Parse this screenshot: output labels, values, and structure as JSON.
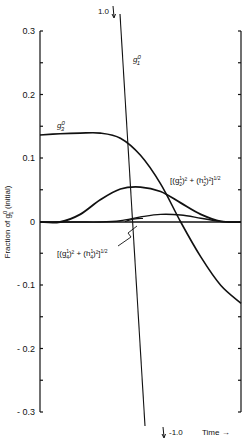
{
  "chart_data": {
    "type": "line",
    "title": "",
    "xlabel": "Time →",
    "ylabel": "Fraction of g₁⁰ (initial)",
    "ylim": [
      -0.3,
      0.3
    ],
    "yticks": [
      0.3,
      0.2,
      0.1,
      0,
      -0.1,
      -0.2,
      -0.3
    ],
    "ytick_labels": [
      "0.3",
      "0.2",
      "0.1",
      "0",
      "- 0.1",
      "- 0.2",
      "- 0.3"
    ],
    "grid": false,
    "legend": "none (curves labelled directly)",
    "x_normalized": [
      0,
      0.1,
      0.2,
      0.3,
      0.4,
      0.5,
      0.6,
      0.7,
      0.8,
      0.9,
      1.0
    ],
    "series": [
      {
        "name": "g₁⁰",
        "label": "g10",
        "note": "steep straight line running from 1.0 (off top) to -1.0 (off bottom)",
        "endpoints": [
          {
            "x": 0.4,
            "y": 1.0
          },
          {
            "x": 0.52,
            "y": -1.0
          }
        ]
      },
      {
        "name": "g₃⁰",
        "label": "g30",
        "values": [
          0.137,
          0.139,
          0.14,
          0.14,
          0.132,
          0.105,
          0.06,
          0.0,
          -0.055,
          -0.1,
          -0.128
        ]
      },
      {
        "name": "[(g₂¹)² + (h₂¹)²]^1/2",
        "label": "g21h21",
        "values": [
          0,
          0.0,
          0.012,
          0.035,
          0.052,
          0.055,
          0.048,
          0.03,
          0.012,
          0.001,
          0
        ]
      },
      {
        "name": "[(g₄¹)² + (h₄¹)²]^1/2",
        "label": "g41h41",
        "values": [
          0,
          0,
          0,
          0,
          0.002,
          0.008,
          0.012,
          0.011,
          0.006,
          0.001,
          0
        ]
      }
    ],
    "annotations": [
      "1.0",
      "-1.0",
      "Time →"
    ]
  },
  "labels": {
    "g1_top": "1.0",
    "g1_bottom": "-1.0",
    "g1_name": "g",
    "g1_sup": "0",
    "g1_sub": "1",
    "g3_name": "g",
    "g3_sup": "0",
    "g3_sub": "3",
    "g21_text": "[(g",
    "g21_sup": "1",
    "g21_sub": "2",
    "g21_mid": ")² + (h",
    "g21_hsup": "1",
    "g21_hsub": "2",
    "g21_end": ")²]",
    "g21_exp": "1/2",
    "g41_text": "[(g",
    "g41_sup": "1",
    "g41_sub": "4",
    "g41_mid": ")² + (h",
    "g41_hsup": "1",
    "g41_hsub": "4",
    "g41_end": ")²]",
    "g41_exp": "1/2",
    "ylabel_prefix": "Fraction of g",
    "ylabel_sup": "0",
    "ylabel_sub": "1",
    "ylabel_suffix": " (initial)",
    "xlabel": "Time →"
  }
}
